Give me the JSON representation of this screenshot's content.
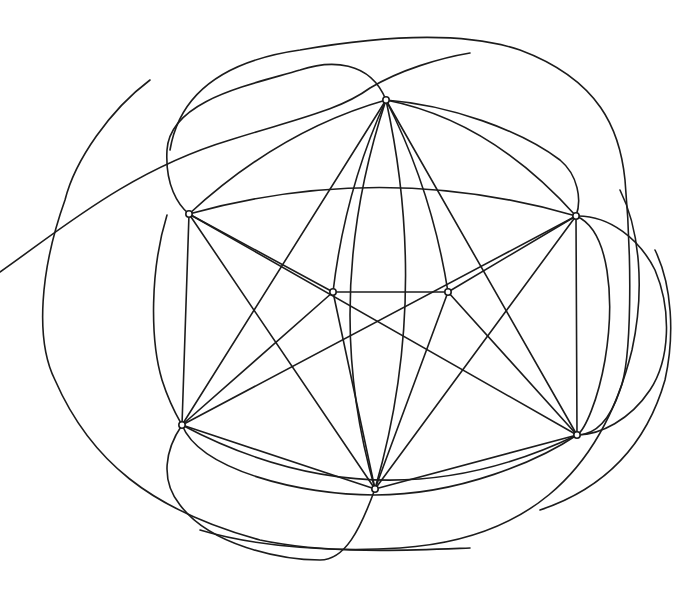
{
  "header": {
    "text": "·· ······"
  },
  "diagram": {
    "type": "graph-drawing",
    "stroke_color": "#1c1c1c",
    "background": "#ffffff",
    "vertices": [
      {
        "id": "A",
        "x": 386,
        "y": 100
      },
      {
        "id": "B",
        "x": 189,
        "y": 214
      },
      {
        "id": "C",
        "x": 576,
        "y": 216
      },
      {
        "id": "D",
        "x": 333,
        "y": 292
      },
      {
        "id": "E",
        "x": 448,
        "y": 292
      },
      {
        "id": "F",
        "x": 182,
        "y": 425
      },
      {
        "id": "G",
        "x": 577,
        "y": 435
      },
      {
        "id": "H",
        "x": 375,
        "y": 489
      }
    ],
    "vertex_count": 8
  }
}
